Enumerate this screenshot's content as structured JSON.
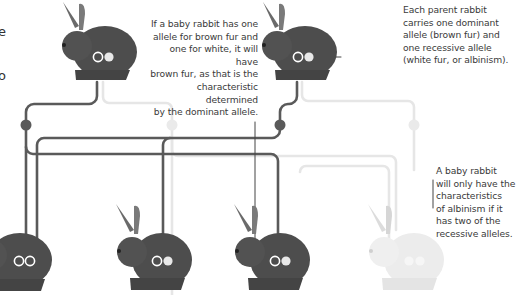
{
  "diagram": {
    "colors": {
      "dominant_line": "#5a5a5a",
      "recessive_line": "#e6e6e6",
      "rabbit_dark": "#4d4d4d",
      "rabbit_light": "#e8e8e8",
      "text": "#3a3a3a",
      "background": "#ffffff"
    },
    "left_edge_fragments": [
      "e",
      "o"
    ],
    "annotations": {
      "parent_note": "Each parent rabbit carries one dominant allele (brown fur) and one recessive allele (white fur, or albinism).",
      "heterozygous_note": "If a baby rabbit has one allele for brown fur and one for white, it will have brown fur, as that is the characteristic determined by the dominant allele.",
      "albino_note": "A baby rabbit will only have the characteristics of albinism if it has two of the recessive alleles."
    },
    "annotation_lines": {
      "parent_note": [
        "Each parent rabbit",
        "carries one dominant",
        "allele (brown fur) and",
        "one recessive allele",
        "(white fur, or albinism)."
      ],
      "heterozygous_note": [
        "If a baby rabbit has one",
        "allele for brown fur and",
        "one for white, it will have",
        "brown fur, as that is the",
        "characteristic determined",
        "by the dominant allele."
      ],
      "albino_note": [
        "A baby rabbit",
        "will only have the",
        "characteristics",
        "of albinism if it",
        "has two of the",
        "recessive alleles."
      ]
    },
    "parents": [
      {
        "id": "parent-1",
        "fur": "brown",
        "alleles": [
          "dominant",
          "recessive"
        ]
      },
      {
        "id": "parent-2",
        "fur": "brown",
        "alleles": [
          "dominant",
          "recessive"
        ]
      }
    ],
    "offspring": [
      {
        "id": "baby-1",
        "fur": "brown",
        "alleles": [
          "dominant",
          "dominant"
        ]
      },
      {
        "id": "baby-2",
        "fur": "brown",
        "alleles": [
          "dominant",
          "recessive"
        ]
      },
      {
        "id": "baby-3",
        "fur": "brown",
        "alleles": [
          "dominant",
          "recessive"
        ]
      },
      {
        "id": "baby-4",
        "fur": "white",
        "alleles": [
          "recessive",
          "recessive"
        ]
      }
    ]
  }
}
